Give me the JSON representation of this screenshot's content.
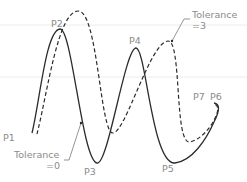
{
  "diagram": {
    "type": "spline-fit-tolerance",
    "colors": {
      "curve": "#2b2b2b",
      "label": "#8a8a8a",
      "leader": "#7a7a7a",
      "guide": "#ececec"
    },
    "points": [
      {
        "id": "P1",
        "label": "P1"
      },
      {
        "id": "P2",
        "label": "P2"
      },
      {
        "id": "P3",
        "label": "P3"
      },
      {
        "id": "P4",
        "label": "P4"
      },
      {
        "id": "P5",
        "label": "P5"
      },
      {
        "id": "P6",
        "label": "P6"
      },
      {
        "id": "P7",
        "label": "P7"
      }
    ],
    "curves": [
      {
        "name": "tolerance-0",
        "style": "solid",
        "label_line1": "Tolerance",
        "label_line2": "=0"
      },
      {
        "name": "tolerance-3",
        "style": "dashed",
        "label_line1": "Tolerance",
        "label_line2": "=3"
      }
    ]
  }
}
